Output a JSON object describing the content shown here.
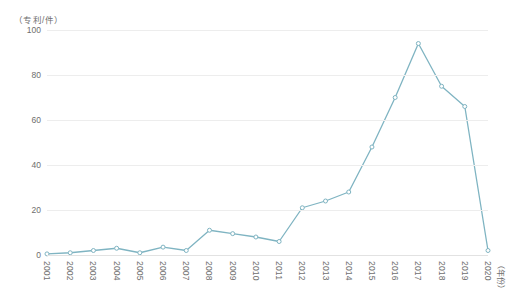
{
  "chart_data": {
    "type": "line",
    "title": "",
    "subtitle": "",
    "xlabel": "（年份）",
    "ylabel": "（专利/件）",
    "ylim": [
      0,
      100
    ],
    "yticks": [
      0,
      20,
      40,
      60,
      80,
      100
    ],
    "grid": true,
    "legend": "none",
    "line_color": "#7fb4c2",
    "marker": "circle-open",
    "categories": [
      "2001",
      "2002",
      "2003",
      "2004",
      "2005",
      "2006",
      "2007",
      "2008",
      "2009",
      "2010",
      "2011",
      "2012",
      "2013",
      "2014",
      "2015",
      "2016",
      "2017",
      "2018",
      "2019",
      "2020"
    ],
    "series": [
      {
        "name": "专利申请量",
        "values": [
          0.5,
          1,
          2,
          3,
          1,
          3.5,
          2,
          11,
          9.5,
          8,
          6,
          21,
          24,
          28,
          48,
          70,
          94,
          75,
          66,
          2
        ]
      }
    ]
  },
  "axes": {
    "y_unit_caption": "（专利/件）",
    "x_unit_caption": "（年份）"
  }
}
